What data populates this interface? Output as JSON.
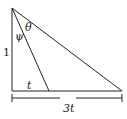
{
  "diagram": {
    "type": "right-triangle",
    "labels": {
      "vertical_side": "1",
      "angle_psi": "ψ",
      "angle_theta": "θ",
      "inner_base": "t",
      "total_base": "3t"
    },
    "colors": {
      "stroke": "#222222",
      "background": "#ffffff"
    }
  }
}
